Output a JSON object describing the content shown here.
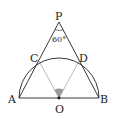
{
  "diagram": {
    "points": {
      "P": {
        "label": "P",
        "x": 59,
        "y": 22
      },
      "A": {
        "label": "A",
        "x": 19,
        "y": 98
      },
      "B": {
        "label": "B",
        "x": 99,
        "y": 98
      },
      "O": {
        "label": "O",
        "x": 59,
        "y": 98
      },
      "C": {
        "label": "C",
        "x": 39,
        "y": 61
      },
      "D": {
        "label": "D",
        "x": 79,
        "y": 61
      }
    },
    "angle_label": "60°",
    "colors": {
      "stroke": "#222222",
      "thin": "#888888",
      "shade": "#999999"
    }
  }
}
